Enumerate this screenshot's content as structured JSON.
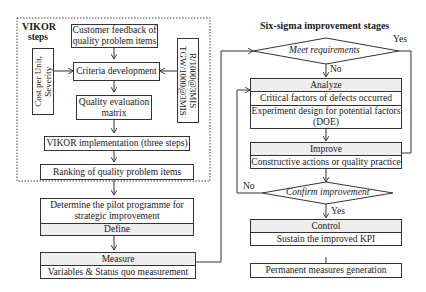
{
  "vikor": {
    "title_line1": "VIKOR",
    "title_line2": "steps",
    "customer_feedback": [
      "Customer feedback of",
      "quality problem items"
    ],
    "criteria_development": "Criteria development",
    "left_inputs": [
      "Cost per Unit,",
      "Severity"
    ],
    "right_inputs": [
      "R/1000@3MIS",
      "TGW/1000@3MIS"
    ],
    "quality_matrix": [
      "Quality evaluation",
      "matrix"
    ],
    "vikor_implementation": "VIKOR implementation (three steps)",
    "ranking": "Ranking of quality problem items"
  },
  "define": {
    "text": [
      "Determine the pilot programme for",
      "strategic improvement"
    ],
    "header": "Define"
  },
  "measure": {
    "header": "Measure",
    "text": "Variables & Status quo measurement"
  },
  "six_sigma": {
    "title": "Six-sigma improvement stages",
    "meet_requirements": "Meet requirements",
    "meet_yes": "Yes",
    "meet_no": "No",
    "analyze": {
      "header": "Analyze",
      "item1": "Critical factors of defects occurred",
      "item2": [
        "Experiment design for potential factors",
        "(DOE)"
      ]
    },
    "improve": {
      "header": "Improve",
      "item1": "Constructive actions or quality practice"
    },
    "confirm_improvement": "Confirm improvement",
    "confirm_no": "No",
    "confirm_yes": "Yes",
    "control": {
      "header": "Control",
      "item1": "Sustain the improved KPI"
    },
    "permanent": "Permanent measures generation"
  },
  "colors": {
    "line": "#333333",
    "header_fill": "#eeeeee",
    "dotted_border": "#444444"
  }
}
